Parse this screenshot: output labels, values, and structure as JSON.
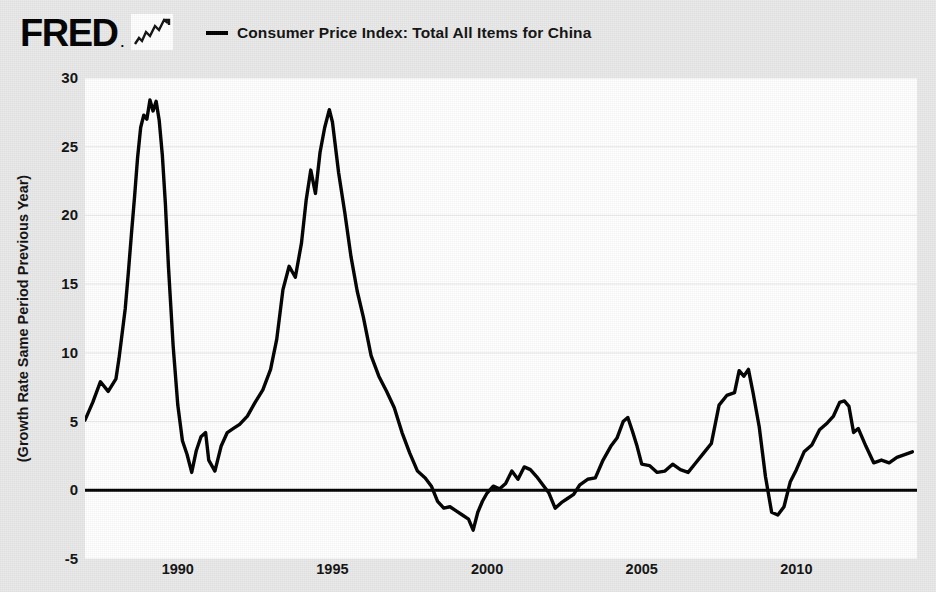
{
  "brand": {
    "name": "FRED",
    "dot": ".",
    "mark_icon": "line-chart-icon"
  },
  "legend": {
    "swatch_icon": "line-swatch-icon",
    "label": "Consumer Price Index: Total All Items for China"
  },
  "axes": {
    "ylabel": "(Growth Rate Same Period Previous Year)",
    "yticks": [
      "30",
      "25",
      "20",
      "15",
      "10",
      "5",
      "0",
      "-5"
    ],
    "xticks": [
      "1990",
      "1995",
      "2000",
      "2005",
      "2010"
    ]
  },
  "colors": {
    "background": "#e9e9e9",
    "plot_background": "#ffffff",
    "line": "#000000",
    "gridline": "#eeeeee",
    "zero_line": "#000000",
    "text": "#111111"
  },
  "chart_data": {
    "type": "line",
    "title": "Consumer Price Index: Total All Items for China",
    "xlabel": "",
    "ylabel": "(Growth Rate Same Period Previous Year)",
    "xlim": [
      1987.0,
      2013.9
    ],
    "ylim": [
      -5,
      30
    ],
    "yticks": [
      -5,
      0,
      5,
      10,
      15,
      20,
      25,
      30
    ],
    "xticks": [
      1990,
      1995,
      2000,
      2005,
      2010
    ],
    "grid": true,
    "legend_position": "top",
    "zero_line": 0,
    "series": [
      {
        "name": "Consumer Price Index: Total All Items for China",
        "color": "#000000",
        "units": "Growth Rate Same Period Previous Year, percent",
        "x": [
          1987.0,
          1987.25,
          1987.5,
          1987.75,
          1988.0,
          1988.1,
          1988.2,
          1988.3,
          1988.4,
          1988.5,
          1988.6,
          1988.7,
          1988.8,
          1988.9,
          1989.0,
          1989.1,
          1989.2,
          1989.3,
          1989.4,
          1989.5,
          1989.6,
          1989.7,
          1989.85,
          1990.0,
          1990.15,
          1990.3,
          1990.45,
          1990.6,
          1990.75,
          1990.9,
          1991.0,
          1991.2,
          1991.4,
          1991.6,
          1991.8,
          1992.0,
          1992.25,
          1992.5,
          1992.75,
          1993.0,
          1993.2,
          1993.4,
          1993.6,
          1993.8,
          1994.0,
          1994.15,
          1994.3,
          1994.45,
          1994.6,
          1994.75,
          1994.9,
          1995.0,
          1995.2,
          1995.4,
          1995.6,
          1995.8,
          1996.0,
          1996.25,
          1996.5,
          1996.75,
          1997.0,
          1997.25,
          1997.5,
          1997.75,
          1998.0,
          1998.2,
          1998.4,
          1998.6,
          1998.8,
          1999.0,
          1999.2,
          1999.4,
          1999.55,
          1999.7,
          1999.85,
          2000.0,
          2000.2,
          2000.4,
          2000.6,
          2000.8,
          2001.0,
          2001.2,
          2001.4,
          2001.6,
          2001.8,
          2002.0,
          2002.2,
          2002.4,
          2002.6,
          2002.8,
          2003.0,
          2003.25,
          2003.5,
          2003.75,
          2004.0,
          2004.2,
          2004.4,
          2004.55,
          2004.7,
          2004.85,
          2005.0,
          2005.25,
          2005.5,
          2005.75,
          2006.0,
          2006.25,
          2006.5,
          2006.75,
          2007.0,
          2007.25,
          2007.5,
          2007.75,
          2008.0,
          2008.15,
          2008.3,
          2008.45,
          2008.6,
          2008.8,
          2009.0,
          2009.2,
          2009.4,
          2009.6,
          2009.8,
          2010.0,
          2010.25,
          2010.5,
          2010.75,
          2011.0,
          2011.2,
          2011.4,
          2011.55,
          2011.7,
          2011.85,
          2012.0,
          2012.25,
          2012.5,
          2012.75,
          2013.0,
          2013.25,
          2013.5,
          2013.75
        ],
        "y": [
          5.1,
          6.4,
          7.9,
          7.2,
          8.1,
          9.6,
          11.4,
          13.2,
          15.8,
          18.6,
          21.3,
          24.2,
          26.4,
          27.3,
          27.0,
          28.4,
          27.6,
          28.3,
          26.9,
          24.4,
          20.8,
          16.2,
          10.5,
          6.2,
          3.6,
          2.6,
          1.3,
          2.9,
          3.9,
          4.2,
          2.2,
          1.4,
          3.2,
          4.2,
          4.5,
          4.8,
          5.4,
          6.4,
          7.3,
          8.8,
          11.0,
          14.6,
          16.3,
          15.5,
          18.0,
          21.1,
          23.3,
          21.6,
          24.6,
          26.4,
          27.7,
          26.8,
          23.1,
          20.2,
          17.0,
          14.5,
          12.6,
          9.8,
          8.3,
          7.2,
          6.0,
          4.2,
          2.7,
          1.4,
          0.9,
          0.3,
          -0.8,
          -1.3,
          -1.2,
          -1.5,
          -1.8,
          -2.1,
          -2.9,
          -1.6,
          -0.8,
          -0.2,
          0.3,
          0.1,
          0.5,
          1.4,
          0.8,
          1.7,
          1.5,
          1.0,
          0.4,
          -0.2,
          -1.3,
          -0.9,
          -0.6,
          -0.3,
          0.4,
          0.8,
          0.9,
          2.2,
          3.2,
          3.8,
          5.0,
          5.3,
          4.3,
          3.2,
          1.9,
          1.8,
          1.3,
          1.4,
          1.9,
          1.5,
          1.3,
          2.0,
          2.7,
          3.4,
          6.2,
          6.9,
          7.1,
          8.7,
          8.3,
          8.8,
          7.1,
          4.6,
          1.0,
          -1.6,
          -1.8,
          -1.2,
          0.6,
          1.5,
          2.8,
          3.3,
          4.4,
          4.9,
          5.4,
          6.4,
          6.5,
          6.1,
          4.2,
          4.5,
          3.2,
          2.0,
          2.2,
          2.0,
          2.4,
          2.6,
          2.8
        ]
      }
    ]
  }
}
